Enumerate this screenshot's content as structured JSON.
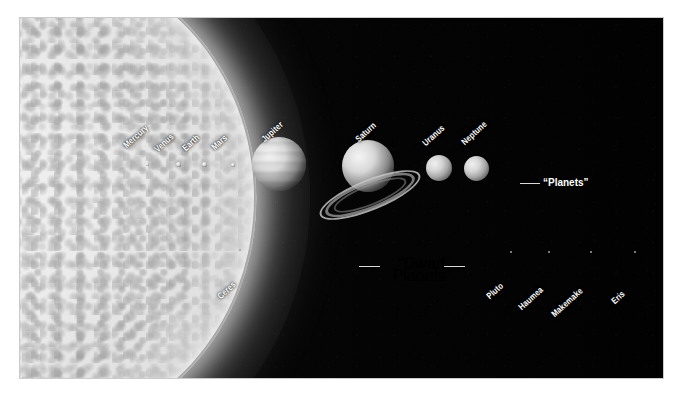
{
  "image": {
    "title": "Solar System bodies to scale",
    "background_color": "#000000",
    "page_color": "#ffffff",
    "label_color": "#ffffff"
  },
  "sun": {
    "name": "Sun",
    "color": "#e8e8e8"
  },
  "planets": [
    {
      "name": "Mercury",
      "dot_x": 146,
      "dot_y": 166,
      "size": 3,
      "label_x": 128,
      "label_y": 133
    },
    {
      "name": "Venus",
      "dot_x": 177,
      "dot_y": 166,
      "size": 5,
      "label_x": 158,
      "label_y": 137
    },
    {
      "name": "Earth",
      "dot_x": 203,
      "dot_y": 166,
      "size": 5,
      "label_x": 187,
      "label_y": 136
    },
    {
      "name": "Mars",
      "dot_x": 231,
      "dot_y": 166,
      "size": 4,
      "label_x": 216,
      "label_y": 135
    },
    {
      "name": "Jupiter",
      "dot_x": 256,
      "dot_y": 137,
      "size": 54,
      "label_x": 266,
      "label_y": 127
    },
    {
      "name": "Saturn",
      "dot_x": 346,
      "dot_y": 139,
      "size": 52,
      "label_x": 360,
      "label_y": 127
    },
    {
      "name": "Uranus",
      "dot_x": 426,
      "dot_y": 155,
      "size": 26,
      "label_x": 427,
      "label_y": 131
    },
    {
      "name": "Neptune",
      "dot_x": 464,
      "dot_y": 156,
      "size": 25,
      "label_x": 466,
      "label_y": 130
    }
  ],
  "dwarf_planets": [
    {
      "name": "Ceres",
      "dot_x": 239,
      "dot_y": 250,
      "size": 2,
      "label_x": 222,
      "label_y": 292
    },
    {
      "name": "Pluto",
      "dot_x": 510,
      "dot_y": 252,
      "size": 2,
      "label_x": 491,
      "label_y": 292
    },
    {
      "name": "Haumea",
      "dot_x": 548,
      "dot_y": 252,
      "size": 2,
      "label_x": 523,
      "label_y": 303
    },
    {
      "name": "Makemake",
      "dot_x": 590,
      "dot_y": 252,
      "size": 2,
      "label_x": 556,
      "label_y": 310
    },
    {
      "name": "Eris",
      "dot_x": 634,
      "dot_y": 252,
      "size": 2,
      "label_x": 616,
      "label_y": 297
    }
  ],
  "callouts": {
    "planets": {
      "text": "“Planets”",
      "x": 543,
      "y": 165
    },
    "dwarf_planets": {
      "line1": "“Dwarf",
      "line2": "Planets”",
      "x": 371,
      "y": 240
    }
  }
}
